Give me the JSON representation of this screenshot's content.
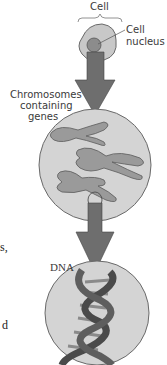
{
  "labels": {
    "cell": "Cell",
    "cell_nucleus_line1": "Cell",
    "cell_nucleus_line2": "nucleus",
    "chromosomes_line1": "Chromosomes",
    "chromosomes_line2": "containing",
    "chromosomes_line3": "genes",
    "dna": "DNA"
  },
  "edge_fragments": {
    "top": "s,",
    "bottom": "d"
  },
  "colors": {
    "cell_fill": "#c8c8c8",
    "cell_stroke": "#6a6a6a",
    "nucleus_fill": "#8c8c8c",
    "arrow_fill": "#6e6e6e",
    "circle_fill": "#d4d4d4",
    "chromosome_fill": "#9a9a9a",
    "dna_strand": "#4a4a4a",
    "dna_base": "#8a8a8a"
  }
}
